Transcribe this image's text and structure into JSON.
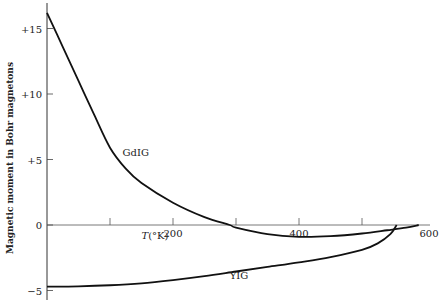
{
  "chart_data": {
    "type": "line",
    "title": "",
    "xlabel": "T(°K)",
    "ylabel": "Magnetic moment in Bohr magnetons",
    "xlim": [
      0,
      600
    ],
    "ylim": [
      -5.5,
      16.5
    ],
    "grid": false,
    "legend": "inline labels",
    "x_ticks": [
      100,
      200,
      300,
      400,
      500,
      600
    ],
    "x_tick_labels": [
      "200",
      "400",
      "600"
    ],
    "y_ticks": [
      15,
      10,
      5,
      0,
      -5
    ],
    "y_tick_labels": [
      "+15",
      "+10",
      "+5",
      "0",
      "−5"
    ],
    "series": [
      {
        "name": "GdIG",
        "label": "GdIG",
        "x": [
          0,
          25,
          50,
          75,
          100,
          125,
          150,
          200,
          250,
          290,
          300,
          350,
          400,
          450,
          500,
          540,
          570,
          590
        ],
        "y": [
          16.2,
          13.6,
          11.0,
          8.4,
          5.9,
          4.3,
          3.2,
          1.7,
          0.6,
          0.0,
          -0.2,
          -0.7,
          -0.9,
          -0.85,
          -0.65,
          -0.4,
          -0.2,
          0.0
        ]
      },
      {
        "name": "YIG",
        "label": "YIG",
        "x": [
          0,
          50,
          100,
          150,
          200,
          250,
          300,
          350,
          400,
          450,
          500,
          525,
          545,
          555
        ],
        "y": [
          -4.7,
          -4.68,
          -4.6,
          -4.45,
          -4.2,
          -3.9,
          -3.55,
          -3.2,
          -2.85,
          -2.45,
          -1.9,
          -1.4,
          -0.7,
          0.0
        ]
      }
    ],
    "annotations": [
      {
        "text": "GdIG",
        "x": 120,
        "y": 5.3
      },
      {
        "text": "YIG",
        "x": 290,
        "y": -4.1
      },
      {
        "text": "T(°K)",
        "x": 150,
        "y": -1.1
      }
    ]
  }
}
